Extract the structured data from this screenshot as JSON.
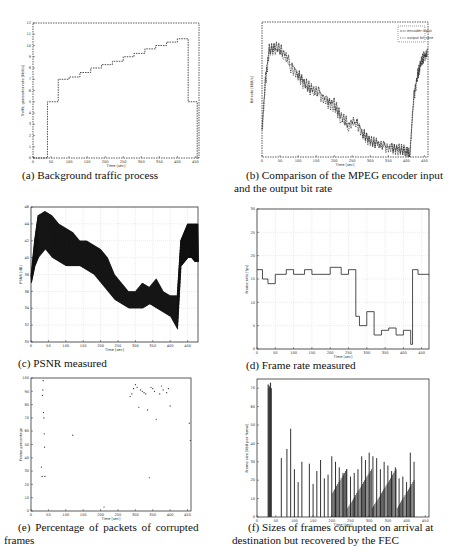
{
  "figure": {
    "panels": [
      {
        "id": "a",
        "caption": "(a) Background traffic process"
      },
      {
        "id": "b",
        "caption_line1": "(b) Comparison of the MPEG encoder input",
        "caption_line2": "and the output bit rate"
      },
      {
        "id": "c",
        "caption": "(c) PSNR measured"
      },
      {
        "id": "d",
        "caption": "(d) Frame rate measured"
      },
      {
        "id": "e",
        "caption_line1": "(e)  Percentage  of  packets  of  corrupted",
        "caption_line2": "frames"
      },
      {
        "id": "f",
        "caption_line1": "(f) Sizes of frames corrupted on arrival at",
        "caption_line2": "destination but recovered by the FEC"
      }
    ]
  },
  "chart_data": [
    {
      "panel": "a",
      "type": "line",
      "title": "",
      "xlabel": "Time [sec]",
      "ylabel": "Traffic generator rate [kbit/s]",
      "xticks": [
        0,
        50,
        100,
        150,
        200,
        250,
        300,
        350,
        400,
        450
      ],
      "yticks": [
        0,
        1,
        2,
        3,
        4,
        5,
        6,
        7,
        8,
        9,
        10,
        11,
        12
      ],
      "xlim": [
        0,
        460
      ],
      "ylim": [
        0,
        12
      ],
      "grid": false,
      "step": true,
      "x": [
        0,
        40,
        40,
        70,
        70,
        100,
        100,
        130,
        130,
        160,
        160,
        190,
        190,
        220,
        220,
        250,
        250,
        280,
        280,
        310,
        310,
        340,
        340,
        370,
        370,
        400,
        400,
        430,
        430,
        455,
        455,
        460
      ],
      "y": [
        0,
        0,
        5,
        5,
        7,
        7,
        7.2,
        7.2,
        7.6,
        7.6,
        8,
        8,
        8.3,
        8.3,
        8.6,
        8.6,
        9,
        9,
        9.3,
        9.3,
        9.7,
        9.7,
        10,
        10,
        10.3,
        10.3,
        10.6,
        10.6,
        5,
        5,
        0,
        0
      ]
    },
    {
      "panel": "b",
      "type": "line",
      "title": "",
      "xlabel": "Time [sec]",
      "ylabel": "Bit rate [kbit/s]",
      "xticks": [
        0,
        50,
        100,
        150,
        200,
        250,
        300,
        350,
        400,
        450
      ],
      "xlim": [
        0,
        460
      ],
      "ylim": [
        0,
        1
      ],
      "legend": {
        "position": "upper right",
        "entries": [
          "encoder input",
          "output bit rate"
        ]
      },
      "series": [
        {
          "name": "encoder input",
          "x": [
            0,
            10,
            20,
            40,
            60,
            80,
            100,
            120,
            140,
            160,
            180,
            200,
            220,
            240,
            260,
            280,
            300,
            320,
            340,
            360,
            380,
            400,
            410,
            420,
            430,
            440,
            450,
            460
          ],
          "y": [
            0.2,
            0.6,
            0.8,
            0.82,
            0.78,
            0.7,
            0.62,
            0.55,
            0.5,
            0.48,
            0.42,
            0.4,
            0.3,
            0.25,
            0.28,
            0.18,
            0.12,
            0.1,
            0.08,
            0.07,
            0.06,
            0.05,
            0.02,
            0.45,
            0.6,
            0.7,
            0.75,
            0.78
          ]
        },
        {
          "name": "output bit rate",
          "x": [
            0,
            10,
            20,
            40,
            60,
            80,
            100,
            120,
            140,
            160,
            180,
            200,
            220,
            240,
            260,
            280,
            300,
            320,
            340,
            360,
            380,
            400,
            410,
            420,
            430,
            440,
            450,
            460
          ],
          "y": [
            0.18,
            0.55,
            0.78,
            0.8,
            0.75,
            0.66,
            0.6,
            0.52,
            0.47,
            0.45,
            0.4,
            0.37,
            0.27,
            0.22,
            0.26,
            0.16,
            0.11,
            0.09,
            0.07,
            0.06,
            0.05,
            0.04,
            0.02,
            0.42,
            0.58,
            0.68,
            0.73,
            0.76
          ]
        }
      ]
    },
    {
      "panel": "c",
      "type": "line",
      "title": "",
      "xlabel": "Time [sec]",
      "ylabel": "PSNR [dB]",
      "xticks": [
        0,
        50,
        100,
        150,
        200,
        250,
        300,
        350,
        400,
        450
      ],
      "yticks": [
        30,
        32,
        34,
        36,
        38,
        40,
        42,
        44,
        46
      ],
      "xlim": [
        0,
        480
      ],
      "ylim": [
        30,
        46
      ],
      "grid": true,
      "x": [
        0,
        10,
        20,
        40,
        60,
        80,
        100,
        120,
        140,
        160,
        180,
        200,
        220,
        240,
        260,
        280,
        300,
        320,
        340,
        360,
        380,
        400,
        420,
        430,
        440,
        450,
        460,
        470,
        480
      ],
      "y_upper": [
        38,
        42,
        45,
        45.5,
        45,
        44,
        43.5,
        43,
        42,
        42,
        41.5,
        41,
        40,
        38,
        37,
        36,
        36,
        37,
        36.5,
        37.5,
        36,
        35.5,
        35.5,
        42,
        43,
        44,
        44,
        44,
        44
      ],
      "y_lower": [
        37,
        39,
        40,
        41,
        40,
        39.5,
        39,
        39,
        39,
        38.5,
        38,
        37,
        36,
        35,
        34.5,
        34,
        34,
        34,
        34.5,
        34,
        33.5,
        33,
        31.5,
        39,
        39.5,
        40,
        40,
        39.5,
        39.5
      ]
    },
    {
      "panel": "d",
      "type": "line",
      "title": "",
      "xlabel": "Time [sec]",
      "ylabel": "Frame rate [fps]",
      "xticks": [
        0,
        50,
        100,
        150,
        200,
        250,
        300,
        350,
        400,
        450
      ],
      "yticks": [
        0,
        5,
        10,
        15,
        20,
        25,
        30
      ],
      "xlim": [
        0,
        470
      ],
      "ylim": [
        0,
        30
      ],
      "grid": true,
      "step": true,
      "x": [
        0,
        15,
        15,
        30,
        30,
        50,
        50,
        80,
        80,
        100,
        100,
        130,
        130,
        150,
        150,
        200,
        200,
        230,
        230,
        250,
        250,
        270,
        270,
        280,
        280,
        300,
        300,
        320,
        320,
        340,
        340,
        360,
        360,
        380,
        380,
        400,
        400,
        420,
        420,
        425,
        425,
        440,
        440,
        470
      ],
      "y": [
        17,
        17,
        15,
        15,
        14,
        14,
        16,
        16,
        17,
        17,
        16,
        16,
        17,
        17,
        16,
        16,
        17.5,
        17.5,
        16,
        16,
        17,
        17,
        7,
        7,
        5,
        5,
        8,
        8,
        3,
        3,
        4,
        4,
        4.5,
        4.5,
        3,
        3,
        4,
        4,
        1,
        1,
        17,
        17,
        16,
        16
      ]
    },
    {
      "panel": "e",
      "type": "scatter",
      "title": "",
      "xlabel": "Time [sec]",
      "ylabel": "Frame percentage",
      "xticks": [
        0,
        50,
        100,
        150,
        200,
        250,
        300,
        350,
        400,
        450
      ],
      "yticks": [
        0,
        10,
        20,
        30,
        40,
        50,
        60,
        70,
        80,
        90,
        100
      ],
      "xlim": [
        0,
        460
      ],
      "ylim": [
        0,
        100
      ],
      "grid": false,
      "x": [
        30,
        32,
        33,
        34,
        35,
        36,
        37,
        38,
        39,
        40,
        120,
        210,
        285,
        290,
        295,
        300,
        305,
        310,
        315,
        320,
        325,
        330,
        335,
        340,
        345,
        350,
        355,
        360,
        370,
        375,
        380,
        390,
        395,
        400,
        455,
        458
      ],
      "y": [
        33,
        26,
        87,
        91,
        98,
        74,
        70,
        58,
        48,
        26,
        57,
        3,
        86,
        88,
        92,
        95,
        93,
        78,
        91,
        90,
        89,
        88,
        76,
        25,
        93,
        92,
        90,
        69,
        88,
        94,
        91,
        89,
        92,
        79,
        66,
        53
      ]
    },
    {
      "panel": "f",
      "type": "bar",
      "title": "",
      "xlabel": "Time [sec]",
      "ylabel": "Frame size [kbit per frame]",
      "xticks": [
        0,
        50,
        100,
        150,
        200,
        250,
        300,
        350,
        400,
        450
      ],
      "yticks": [
        0,
        10,
        20,
        30,
        40,
        50,
        60,
        70
      ],
      "xlim": [
        0,
        460
      ],
      "ylim": [
        0,
        75
      ],
      "grid": false,
      "x": [
        30,
        32,
        34,
        36,
        38,
        65,
        80,
        90,
        100,
        110,
        120,
        140,
        150,
        160,
        170,
        180,
        190,
        200,
        210,
        220,
        230,
        240,
        250,
        260,
        270,
        280,
        290,
        300,
        310,
        320,
        330,
        340,
        350,
        360,
        370,
        380,
        390,
        400,
        410,
        420
      ],
      "values": [
        72,
        70,
        71,
        73,
        70,
        32,
        37,
        48,
        26,
        19,
        30,
        29,
        18,
        25,
        31,
        21,
        23,
        33,
        30,
        27,
        24,
        26,
        22,
        24,
        26,
        33,
        31,
        35,
        33,
        32,
        26,
        30,
        28,
        25,
        27,
        21,
        22,
        19,
        35,
        30
      ]
    }
  ]
}
